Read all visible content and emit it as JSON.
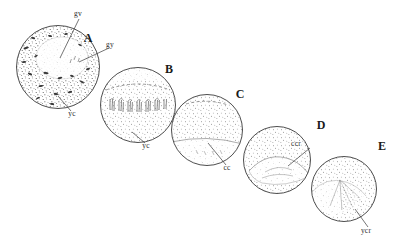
{
  "figure": {
    "background_color": "#ffffff",
    "ink_color": "#3a3a3a",
    "stipple_color": "#4a4a4a"
  },
  "stages": [
    {
      "id": "A",
      "letter": "A",
      "cx": 58,
      "cy": 67,
      "r": 42,
      "description": "densely stippled oocyte with germinal vesicle"
    },
    {
      "id": "B",
      "letter": "B",
      "cx": 138,
      "cy": 105,
      "r": 38,
      "description": "oocyte with cortical comb structures and dashed arc"
    },
    {
      "id": "C",
      "letter": "C",
      "cx": 207,
      "cy": 130,
      "r": 36,
      "description": "oocyte with basal clear cytoplasm band"
    },
    {
      "id": "D",
      "letter": "D",
      "cx": 277,
      "cy": 160,
      "r": 34,
      "description": "oocyte with lens shaped clear cytoplasm region"
    },
    {
      "id": "E",
      "letter": "E",
      "cx": 344,
      "cy": 189,
      "r": 33,
      "description": "oocyte with wedge shaped yolk cytoplasm region"
    }
  ],
  "stage_letters": [
    {
      "text": "A",
      "x": 88,
      "y": 42
    },
    {
      "text": "B",
      "x": 169,
      "y": 73
    },
    {
      "text": "C",
      "x": 240,
      "y": 98
    },
    {
      "text": "D",
      "x": 321,
      "y": 129
    },
    {
      "text": "E",
      "x": 382,
      "y": 150
    }
  ],
  "part_labels": [
    {
      "id": "gv-a",
      "text": "gv",
      "meaning": "germinal vesicle",
      "x": 78,
      "y": 16,
      "leader": "M 79,19 L 60,58"
    },
    {
      "id": "gy-a",
      "text": "gy",
      "meaning": "gyre",
      "x": 110,
      "y": 47,
      "leader": "M 109,48 L 79,62"
    },
    {
      "id": "yc-a",
      "text": "yc",
      "meaning": "yolk cytoplasm",
      "x": 72,
      "y": 116,
      "leader": "M 71,111 L 58,96"
    },
    {
      "id": "yc-b",
      "text": "yc",
      "meaning": "yolk cytoplasm",
      "x": 146,
      "y": 148,
      "leader": "M 145,143 L 132,132"
    },
    {
      "id": "cc-c",
      "text": "cc",
      "meaning": "clear cytoplasm",
      "x": 227,
      "y": 170,
      "leader": "M 226,165 L 208,143"
    },
    {
      "id": "ccr-d",
      "text": "ccr",
      "meaning": "clear cytoplasm region",
      "x": 296,
      "y": 146,
      "leader": "M 310,148 L 288,166"
    },
    {
      "id": "ycr-e",
      "text": "ycr",
      "meaning": "yolk cytoplasm region",
      "x": 366,
      "y": 233,
      "leader": "M 368,227 L 355,209"
    }
  ]
}
